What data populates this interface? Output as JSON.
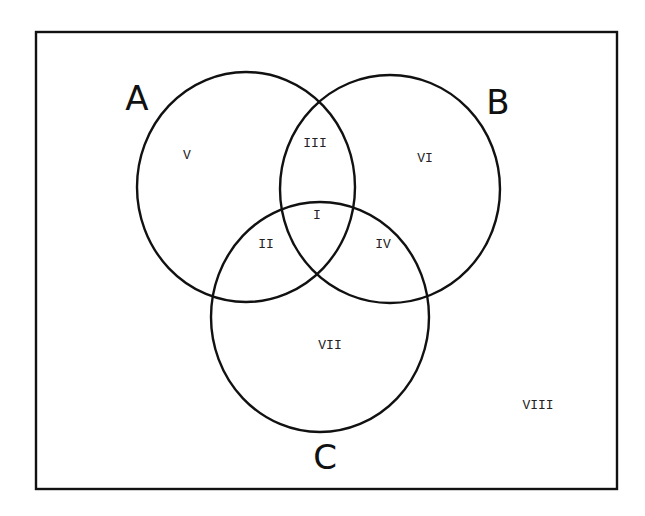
{
  "diagram": {
    "type": "venn",
    "universe": {
      "label": "VIII",
      "x": 36,
      "y": 32,
      "width": 581,
      "height": 457
    },
    "sets": [
      {
        "id": "A",
        "label": "A",
        "cx": 246,
        "cy": 187,
        "rx": 109,
        "ry": 115,
        "label_x": 137,
        "label_y": 110
      },
      {
        "id": "B",
        "label": "B",
        "cx": 390,
        "cy": 189,
        "rx": 110,
        "ry": 114,
        "label_x": 498,
        "label_y": 114
      },
      {
        "id": "C",
        "label": "C",
        "cx": 320,
        "cy": 317,
        "rx": 109,
        "ry": 115,
        "label_x": 325,
        "label_y": 469
      }
    ],
    "regions": [
      {
        "label": "I",
        "meaning": "A ∩ B ∩ C",
        "x": 317,
        "y": 219
      },
      {
        "label": "II",
        "meaning": "A ∩ C only",
        "x": 266,
        "y": 248
      },
      {
        "label": "III",
        "meaning": "A ∩ B only",
        "x": 315,
        "y": 147
      },
      {
        "label": "IV",
        "meaning": "B ∩ C only",
        "x": 383,
        "y": 248
      },
      {
        "label": "V",
        "meaning": "A only",
        "x": 187,
        "y": 159
      },
      {
        "label": "VI",
        "meaning": "B only",
        "x": 425,
        "y": 162
      },
      {
        "label": "VII",
        "meaning": "C only",
        "x": 330,
        "y": 349
      },
      {
        "label": "VIII",
        "meaning": "outside A, B, C",
        "x": 538,
        "y": 409
      }
    ],
    "colors": {
      "stroke": "#111111",
      "background": "#ffffff"
    }
  }
}
